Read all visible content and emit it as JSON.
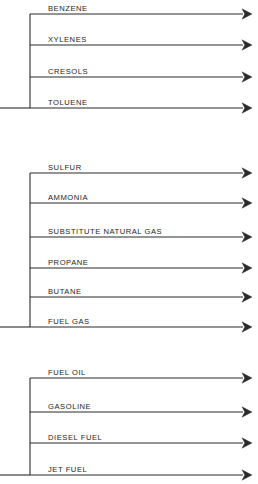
{
  "diagram": {
    "background_color": "#ffffff",
    "line_color": "#2b2b2b",
    "text_color": "#1d1d1d",
    "geometry": {
      "width": 258,
      "height": 484,
      "trunk_x": 30,
      "label_x": 48,
      "arrow_tip_x": 252,
      "line_start_x": 30
    },
    "groups": [
      {
        "id": "group-aromatics",
        "trunk_top_y": 14,
        "trunk_bottom_y": 108,
        "has_left_stub": true,
        "streams": [
          {
            "label": "BENZENE",
            "y": 14
          },
          {
            "label": "XYLENES",
            "y": 45
          },
          {
            "label": "CRESOLS",
            "y": 77
          },
          {
            "label": "TOLUENE",
            "y": 108
          }
        ]
      },
      {
        "id": "group-gases",
        "trunk_top_y": 173,
        "trunk_bottom_y": 327,
        "has_left_stub": true,
        "streams": [
          {
            "label": "SULFUR",
            "y": 173
          },
          {
            "label": "AMMONIA",
            "y": 203
          },
          {
            "label": "SUBSTITUTE NATURAL GAS",
            "y": 237
          },
          {
            "label": "PROPANE",
            "y": 268
          },
          {
            "label": "BUTANE",
            "y": 297
          },
          {
            "label": "FUEL GAS",
            "y": 327
          }
        ]
      },
      {
        "id": "group-fuels",
        "trunk_top_y": 378,
        "trunk_bottom_y": 475,
        "has_left_stub": true,
        "streams": [
          {
            "label": "FUEL OIL",
            "y": 378
          },
          {
            "label": "GASOLINE",
            "y": 412
          },
          {
            "label": "DIESEL FUEL",
            "y": 443
          },
          {
            "label": "JET FUEL",
            "y": 475
          }
        ]
      }
    ]
  }
}
